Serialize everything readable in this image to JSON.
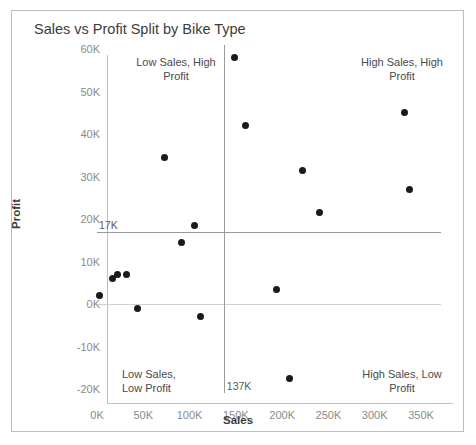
{
  "chart_data": {
    "type": "scatter",
    "title": "Sales vs Profit Split by Bike Type",
    "xlabel": "Sales",
    "ylabel": "Profit",
    "xlim": [
      0,
      372000
    ],
    "ylim": [
      -20000,
      60000
    ],
    "grid": false,
    "legend": "none",
    "x_ticks": [
      "0K",
      "50K",
      "100K",
      "150K",
      "200K",
      "250K",
      "300K",
      "350K"
    ],
    "x_tick_values": [
      0,
      50000,
      100000,
      150000,
      200000,
      250000,
      300000,
      350000
    ],
    "y_ticks": [
      "60K",
      "50K",
      "40K",
      "30K",
      "20K",
      "10K",
      "0K",
      "-10K",
      "-20K"
    ],
    "y_tick_values": [
      60000,
      50000,
      40000,
      30000,
      20000,
      10000,
      0,
      -10000,
      -20000
    ],
    "reference_lines": [
      {
        "orientation": "horizontal",
        "value": 17000,
        "label": "17K"
      },
      {
        "orientation": "vertical",
        "value": 137000,
        "label": "137K"
      }
    ],
    "zero_line": {
      "orientation": "horizontal",
      "value": 0
    },
    "annotations": [
      {
        "name": "low-sales-high-profit",
        "text": "Low Sales, High\nProfit"
      },
      {
        "name": "high-sales-high-profit",
        "text": "High Sales, High\nProfit"
      },
      {
        "name": "low-sales-low-profit",
        "text": "Low Sales,\nLow Profit"
      },
      {
        "name": "high-sales-low-profit",
        "text": "High Sales, Low\nProfit"
      }
    ],
    "points": [
      {
        "x": 3000,
        "y": 2000
      },
      {
        "x": 17000,
        "y": 6000
      },
      {
        "x": 22000,
        "y": 7000
      },
      {
        "x": 32000,
        "y": 7000
      },
      {
        "x": 44000,
        "y": -1000
      },
      {
        "x": 73000,
        "y": 34500
      },
      {
        "x": 91000,
        "y": 14500
      },
      {
        "x": 105000,
        "y": 18500
      },
      {
        "x": 112000,
        "y": -3000
      },
      {
        "x": 149000,
        "y": 58000
      },
      {
        "x": 160000,
        "y": 42000
      },
      {
        "x": 194000,
        "y": 3500
      },
      {
        "x": 208000,
        "y": -17500
      },
      {
        "x": 222000,
        "y": 31500
      },
      {
        "x": 240000,
        "y": 21500
      },
      {
        "x": 332000,
        "y": 45000
      },
      {
        "x": 338000,
        "y": 27000
      }
    ]
  },
  "colors": {
    "point": "#1a1a1a",
    "reference_line": "#9a9a9a",
    "axis": "#c0c0c0",
    "tick_text": "#8a8a8a",
    "title_text": "#3c3c3c",
    "border": "#bdbdbd"
  }
}
